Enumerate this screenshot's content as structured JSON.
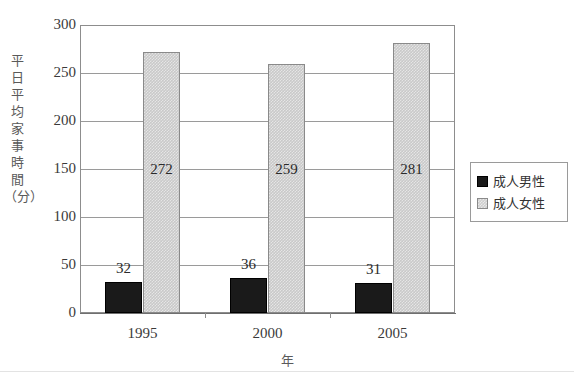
{
  "chart_data": {
    "type": "bar",
    "title": "",
    "xlabel": "年",
    "ylabel": "平日平均家事時間（分）",
    "categories": [
      "1995",
      "2000",
      "2005"
    ],
    "series": [
      {
        "name": "成人男性",
        "values": [
          32,
          36,
          31
        ],
        "color": "#1a1a1a"
      },
      {
        "name": "成人女性",
        "values": [
          272,
          259,
          281
        ],
        "color": "#c9c9c9"
      }
    ],
    "ylim": [
      0,
      300
    ],
    "ytick_labels": [
      "0",
      "50",
      "100",
      "150",
      "200",
      "250",
      "300"
    ],
    "ytick_values": [
      0,
      50,
      100,
      150,
      200,
      250,
      300
    ],
    "grid": true,
    "legend_position": "right",
    "data_labels": {
      "male": [
        "32",
        "36",
        "31"
      ],
      "female": [
        "272",
        "259",
        "281"
      ]
    }
  },
  "ylabel_chars": [
    "平",
    "日",
    "平",
    "均",
    "家",
    "事",
    "時",
    "間",
    "（分）"
  ],
  "legend": {
    "entries": [
      {
        "label": "成人男性",
        "swatch": "black-square-icon"
      },
      {
        "label": "成人女性",
        "swatch": "gray-square-icon"
      }
    ]
  }
}
